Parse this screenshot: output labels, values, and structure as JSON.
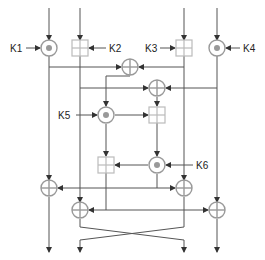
{
  "diagram": {
    "title": "",
    "type": "IDEA cipher round",
    "key_labels": {
      "k1": "K1",
      "k2": "K2",
      "k3": "K3",
      "k4": "K4",
      "k5": "K5",
      "k6": "K6"
    },
    "operations": [
      {
        "id": "mult-k1",
        "kind": "modular-multiply",
        "key": "K1"
      },
      {
        "id": "add-k2",
        "kind": "modular-add",
        "key": "K2"
      },
      {
        "id": "add-k3",
        "kind": "modular-add",
        "key": "K3"
      },
      {
        "id": "mult-k4",
        "kind": "modular-multiply",
        "key": "K4"
      },
      {
        "id": "xor-1",
        "kind": "xor"
      },
      {
        "id": "xor-2",
        "kind": "xor"
      },
      {
        "id": "mult-k5",
        "kind": "modular-multiply",
        "key": "K5"
      },
      {
        "id": "add-ma-1",
        "kind": "modular-add"
      },
      {
        "id": "add-ma-2",
        "kind": "modular-add"
      },
      {
        "id": "mult-k6",
        "kind": "modular-multiply",
        "key": "K6"
      },
      {
        "id": "xor-3",
        "kind": "xor"
      },
      {
        "id": "xor-4",
        "kind": "xor"
      },
      {
        "id": "xor-5",
        "kind": "xor"
      },
      {
        "id": "xor-6",
        "kind": "xor"
      }
    ],
    "colors": {
      "line": "#555555",
      "operator_stroke": "#999999",
      "adder_stroke": "#bbbbbb"
    }
  }
}
